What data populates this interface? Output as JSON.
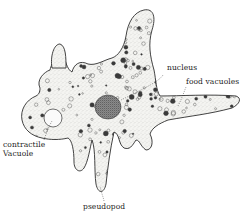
{
  "diagram": {
    "labels": {
      "nucleus": "nucleus",
      "food_vacuoles": "food vacuoles",
      "contractile_vacuole_line1": "contractile",
      "contractile_vacuole_line2": "Vacuole",
      "pseudopod": "pseudopod"
    },
    "colors": {
      "outline": "#2b2b2b",
      "cytoplasm": "#f4f4f1",
      "stipple": "#8a8a8a",
      "nucleus": "#6e6e6e",
      "vacuole_dark": "#3a3a3a",
      "background": "#ffffff"
    }
  }
}
